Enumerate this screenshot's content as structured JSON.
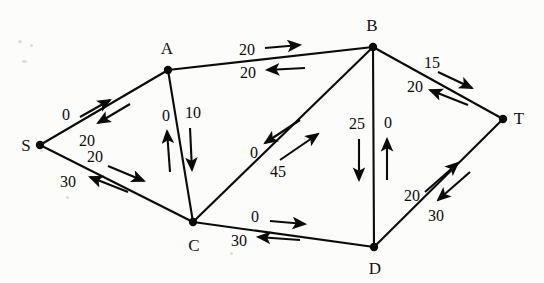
{
  "diagram": {
    "type": "network-flow-graph",
    "background_color": "#fcfcfa",
    "line_color": "#0b0b0b",
    "nodes": [
      {
        "id": "S",
        "label": "S",
        "x": 40,
        "y": 145,
        "label_x": 26,
        "label_y": 145
      },
      {
        "id": "A",
        "label": "A",
        "x": 168,
        "y": 70,
        "label_x": 167,
        "label_y": 48
      },
      {
        "id": "B",
        "label": "B",
        "x": 373,
        "y": 47,
        "label_x": 372,
        "label_y": 25
      },
      {
        "id": "C",
        "label": "C",
        "x": 193,
        "y": 222,
        "label_x": 194,
        "label_y": 245
      },
      {
        "id": "D",
        "label": "D",
        "x": 374,
        "y": 247,
        "label_x": 375,
        "label_y": 268
      },
      {
        "id": "T",
        "label": "T",
        "x": 503,
        "y": 119,
        "label_x": 519,
        "label_y": 118
      }
    ],
    "edges": [
      {
        "id": "S-A",
        "from": "S",
        "to": "A"
      },
      {
        "id": "S-C",
        "from": "S",
        "to": "C"
      },
      {
        "id": "A-B",
        "from": "A",
        "to": "B"
      },
      {
        "id": "A-C",
        "from": "A",
        "to": "C"
      },
      {
        "id": "C-B",
        "from": "C",
        "to": "B"
      },
      {
        "id": "C-D",
        "from": "C",
        "to": "D"
      },
      {
        "id": "B-D",
        "from": "B",
        "to": "D"
      },
      {
        "id": "B-T",
        "from": "B",
        "to": "T"
      },
      {
        "id": "D-T",
        "from": "D",
        "to": "T"
      }
    ],
    "flows": [
      {
        "id": "S-to-A",
        "edge": "S-A",
        "from": "S",
        "to": "A",
        "value": "0",
        "label_x": 66,
        "label_y": 115,
        "arrow": {
          "x1": 80,
          "y1": 117,
          "x2": 110,
          "y2": 100
        }
      },
      {
        "id": "A-to-S",
        "edge": "S-A",
        "from": "A",
        "to": "S",
        "value": "20",
        "label_x": 87,
        "label_y": 141,
        "arrow": {
          "x1": 130,
          "y1": 104,
          "x2": 98,
          "y2": 123
        }
      },
      {
        "id": "S-to-C",
        "edge": "S-C",
        "from": "S",
        "to": "C",
        "value": "20",
        "label_x": 95,
        "label_y": 157,
        "arrow": {
          "x1": 108,
          "y1": 166,
          "x2": 144,
          "y2": 181
        }
      },
      {
        "id": "C-to-S",
        "edge": "S-C",
        "from": "C",
        "to": "S",
        "value": "30",
        "label_x": 68,
        "label_y": 182,
        "arrow": {
          "x1": 128,
          "y1": 192,
          "x2": 90,
          "y2": 177
        }
      },
      {
        "id": "A-to-B",
        "edge": "A-B",
        "from": "A",
        "to": "B",
        "value": "20",
        "label_x": 247,
        "label_y": 50,
        "arrow": {
          "x1": 265,
          "y1": 48,
          "x2": 300,
          "y2": 45
        }
      },
      {
        "id": "B-to-A",
        "edge": "A-B",
        "from": "B",
        "to": "A",
        "value": "20",
        "label_x": 248,
        "label_y": 73,
        "arrow": {
          "x1": 305,
          "y1": 68,
          "x2": 267,
          "y2": 70
        }
      },
      {
        "id": "C-to-A",
        "edge": "A-C",
        "from": "C",
        "to": "A",
        "value": "0",
        "label_x": 166,
        "label_y": 116,
        "arrow": {
          "x1": 170,
          "y1": 172,
          "x2": 167,
          "y2": 131
        }
      },
      {
        "id": "A-to-C",
        "edge": "A-C",
        "from": "A",
        "to": "C",
        "value": "10",
        "label_x": 193,
        "label_y": 113,
        "arrow": {
          "x1": 190,
          "y1": 128,
          "x2": 192,
          "y2": 170
        }
      },
      {
        "id": "B-to-C",
        "edge": "C-B",
        "from": "B",
        "to": "C",
        "value": "0",
        "label_x": 254,
        "label_y": 153,
        "arrow": {
          "x1": 300,
          "y1": 120,
          "x2": 265,
          "y2": 143
        }
      },
      {
        "id": "C-to-B",
        "edge": "C-B",
        "from": "C",
        "to": "B",
        "value": "45",
        "label_x": 278,
        "label_y": 172,
        "arrow": {
          "x1": 280,
          "y1": 160,
          "x2": 318,
          "y2": 134
        }
      },
      {
        "id": "C-to-D",
        "edge": "C-D",
        "from": "C",
        "to": "D",
        "value": "0",
        "label_x": 255,
        "label_y": 217,
        "arrow": {
          "x1": 270,
          "y1": 221,
          "x2": 305,
          "y2": 224
        }
      },
      {
        "id": "D-to-C",
        "edge": "C-D",
        "from": "D",
        "to": "C",
        "value": "30",
        "label_x": 239,
        "label_y": 241,
        "arrow": {
          "x1": 300,
          "y1": 240,
          "x2": 258,
          "y2": 237
        }
      },
      {
        "id": "B-to-D",
        "edge": "B-D",
        "from": "B",
        "to": "D",
        "value": "25",
        "label_x": 357,
        "label_y": 124,
        "arrow": {
          "x1": 359,
          "y1": 139,
          "x2": 359,
          "y2": 180
        }
      },
      {
        "id": "D-to-B",
        "edge": "B-D",
        "from": "D",
        "to": "B",
        "value": "0",
        "label_x": 388,
        "label_y": 123,
        "arrow": {
          "x1": 387,
          "y1": 180,
          "x2": 387,
          "y2": 139
        }
      },
      {
        "id": "B-to-T",
        "edge": "B-T",
        "from": "B",
        "to": "T",
        "value": "15",
        "label_x": 432,
        "label_y": 63,
        "arrow": {
          "x1": 438,
          "y1": 72,
          "x2": 472,
          "y2": 88
        }
      },
      {
        "id": "T-to-B",
        "edge": "B-T",
        "from": "T",
        "to": "B",
        "value": "20",
        "label_x": 415,
        "label_y": 87,
        "arrow": {
          "x1": 468,
          "y1": 105,
          "x2": 430,
          "y2": 90
        }
      },
      {
        "id": "D-to-T",
        "edge": "D-T",
        "from": "D",
        "to": "T",
        "value": "20",
        "label_x": 412,
        "label_y": 196,
        "arrow": {
          "x1": 425,
          "y1": 192,
          "x2": 458,
          "y2": 163
        }
      },
      {
        "id": "T-to-D",
        "edge": "D-T",
        "from": "T",
        "to": "D",
        "value": "30",
        "label_x": 436,
        "label_y": 216,
        "arrow": {
          "x1": 470,
          "y1": 172,
          "x2": 438,
          "y2": 200
        }
      }
    ]
  }
}
